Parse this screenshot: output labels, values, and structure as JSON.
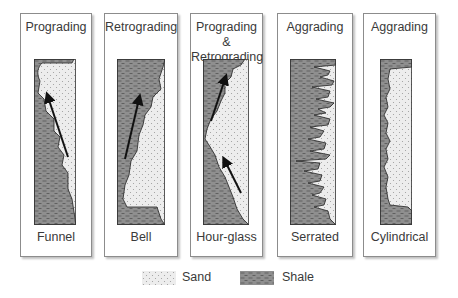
{
  "diagram": {
    "type": "well-log-shape-classification",
    "panels": [
      {
        "title": "Prograding",
        "shape": "Funnel",
        "arrows": 1
      },
      {
        "title": "Retrograding",
        "shape": "Bell",
        "arrows": 1
      },
      {
        "title": "Prograding & Retrograding",
        "title_line1": "Prograding &",
        "title_line2": "Retrograding",
        "shape": "Hour-glass",
        "arrows": 2
      },
      {
        "title": "Aggrading",
        "shape": "Serrated",
        "arrows": 0
      },
      {
        "title": "Aggrading",
        "shape": "Cylindrical",
        "arrows": 0
      }
    ],
    "legend": [
      {
        "label": "Sand",
        "pattern": "dotted",
        "color": "#e6e6e6"
      },
      {
        "label": "Shale",
        "pattern": "dashed",
        "color": "#8a8a8a"
      }
    ]
  },
  "colors": {
    "sand_fill": "#ececec",
    "shale_fill": "#8e8e8e",
    "border": "#8c8c8c",
    "text": "#3a3a3a"
  }
}
